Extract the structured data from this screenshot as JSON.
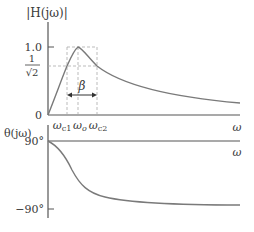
{
  "magnitude_plot": {
    "y_axis_label": "|H(jω)|",
    "x_axis_label": "ω",
    "y_ticks": [
      {
        "label": "1.0",
        "value": 1.0
      },
      {
        "label_num": "1",
        "label_den": "√2",
        "value": 0.707
      },
      {
        "label": "0",
        "value": 0
      }
    ],
    "x_markers": [
      "ω",
      "ω",
      "ω"
    ],
    "x_marker_subs": [
      "c1",
      "o",
      "c2"
    ],
    "bandwidth_label": "β"
  },
  "phase_plot": {
    "y_axis_label": "θ(jω)",
    "x_axis_label": "ω",
    "y_ticks": [
      {
        "label": "90°",
        "value": 90
      },
      {
        "label": "−90°",
        "value": -90
      }
    ]
  },
  "colors": {
    "curve": "#7a7a7a",
    "axis": "#555555",
    "dash": "#aaaaaa",
    "text": "#3a3a3a"
  }
}
